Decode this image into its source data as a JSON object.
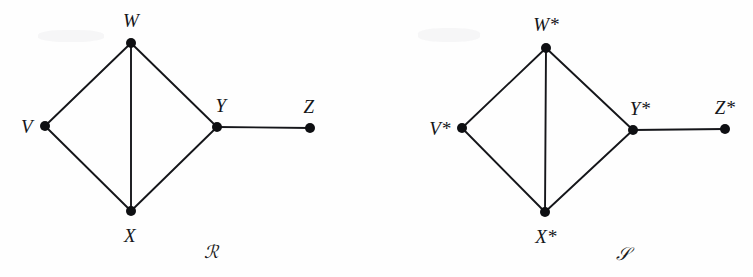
{
  "figure": {
    "background_color": "#fefefe",
    "stroke_color": "#15161a",
    "vertex_color": "#0e0f12"
  },
  "graphs": [
    {
      "id": "graph-R",
      "caption": "ℛ",
      "caption_pos": {
        "x": 211,
        "y": 252
      },
      "vertices": [
        {
          "id": "V",
          "label": "V",
          "x": 45,
          "y": 126,
          "label_x": 27,
          "label_y": 126
        },
        {
          "id": "W",
          "label": "W",
          "x": 131,
          "y": 43,
          "label_x": 131,
          "label_y": 20
        },
        {
          "id": "X",
          "label": "X",
          "x": 131,
          "y": 211,
          "label_x": 130,
          "label_y": 235
        },
        {
          "id": "Y",
          "label": "Y",
          "x": 217,
          "y": 127,
          "label_x": 221,
          "label_y": 105
        },
        {
          "id": "Z",
          "label": "Z",
          "x": 310,
          "y": 128,
          "label_x": 309,
          "label_y": 106
        }
      ],
      "edges": [
        [
          "V",
          "W"
        ],
        [
          "V",
          "X"
        ],
        [
          "W",
          "X"
        ],
        [
          "W",
          "Y"
        ],
        [
          "X",
          "Y"
        ],
        [
          "Y",
          "Z"
        ]
      ]
    },
    {
      "id": "graph-S",
      "caption": "𝒮",
      "caption_pos": {
        "x": 623,
        "y": 254
      },
      "vertices": [
        {
          "id": "Vs",
          "label": "V*",
          "x": 462,
          "y": 128,
          "label_x": 440,
          "label_y": 128
        },
        {
          "id": "Ws",
          "label": "W*",
          "x": 546,
          "y": 48,
          "label_x": 546,
          "label_y": 24
        },
        {
          "id": "Xs",
          "label": "X*",
          "x": 545,
          "y": 212,
          "label_x": 546,
          "label_y": 236
        },
        {
          "id": "Ys",
          "label": "Y*",
          "x": 633,
          "y": 130,
          "label_x": 640,
          "label_y": 108
        },
        {
          "id": "Zs",
          "label": "Z*",
          "x": 725,
          "y": 129,
          "label_x": 725,
          "label_y": 107
        }
      ],
      "edges": [
        [
          "Vs",
          "Ws"
        ],
        [
          "Vs",
          "Xs"
        ],
        [
          "Ws",
          "Xs"
        ],
        [
          "Ws",
          "Ys"
        ],
        [
          "Xs",
          "Ys"
        ],
        [
          "Ys",
          "Zs"
        ]
      ]
    }
  ],
  "artifacts": [
    {
      "x": 38,
      "y": 30,
      "w": 66,
      "h": 12
    },
    {
      "x": 418,
      "y": 28,
      "w": 62,
      "h": 14
    }
  ]
}
